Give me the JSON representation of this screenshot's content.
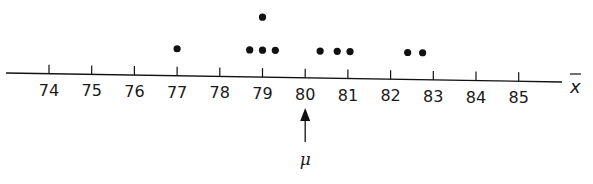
{
  "chart_data": {
    "type": "scatter",
    "subtype": "dot-plot",
    "title": "",
    "xlabel": "x̄",
    "ylabel": "",
    "xlim": [
      73,
      86
    ],
    "x_ticks": [
      74,
      75,
      76,
      77,
      78,
      79,
      80,
      81,
      82,
      83,
      84,
      85
    ],
    "tick_labels": [
      "74",
      "75",
      "76",
      "77",
      "78",
      "79",
      "80",
      "81",
      "82",
      "83",
      "84",
      "85"
    ],
    "points": [
      {
        "x": 77.0,
        "stack": 1
      },
      {
        "x": 78.7,
        "stack": 1
      },
      {
        "x": 79.0,
        "stack": 1
      },
      {
        "x": 79.0,
        "stack": 2
      },
      {
        "x": 79.3,
        "stack": 1
      },
      {
        "x": 80.35,
        "stack": 1
      },
      {
        "x": 80.75,
        "stack": 1
      },
      {
        "x": 81.05,
        "stack": 1
      },
      {
        "x": 82.4,
        "stack": 1
      },
      {
        "x": 82.75,
        "stack": 1
      }
    ],
    "x_values": [
      77.0,
      78.7,
      79.0,
      79.0,
      79.3,
      80.35,
      80.75,
      81.05,
      82.4,
      82.75
    ],
    "annotations": [
      {
        "type": "arrow",
        "x": 80,
        "label": "μ",
        "direction": "up",
        "position": "below-axis"
      }
    ],
    "grid": false,
    "legend": null,
    "colors": {
      "ink": "#111111",
      "background": "#ffffff"
    }
  }
}
